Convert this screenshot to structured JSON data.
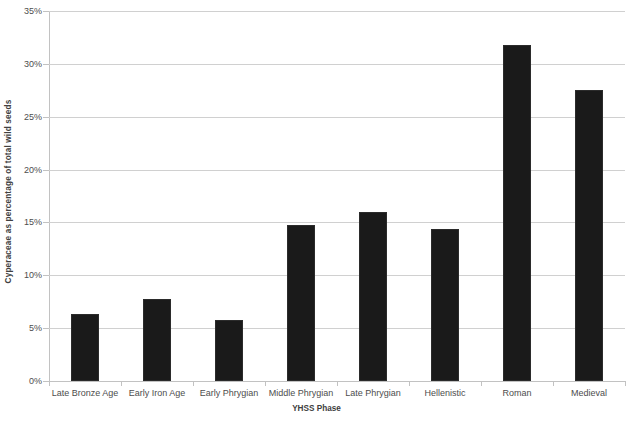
{
  "chart_data": {
    "type": "bar",
    "title": "",
    "xlabel": "YHSS Phase",
    "ylabel": "Cyperaceae as percentage of total wild seeds",
    "categories": [
      "Late Bronze Age",
      "Early Iron Age",
      "Early Phrygian",
      "Middle Phrygian",
      "Late Phrygian",
      "Hellenistic",
      "Roman",
      "Medieval"
    ],
    "values": [
      6.3,
      7.8,
      5.8,
      14.8,
      16.0,
      14.4,
      31.8,
      27.5
    ],
    "ylim": [
      0,
      35
    ],
    "ytick_values": [
      0,
      5,
      10,
      15,
      20,
      25,
      30,
      35
    ],
    "ytick_labels": [
      "0%",
      "5%",
      "10%",
      "15%",
      "20%",
      "25%",
      "30%",
      "35%"
    ],
    "grid": true,
    "legend": false,
    "bar_color": "#1a1a1a",
    "gridline_color": "#d0d0d0",
    "axis_color": "#c2c2c2"
  }
}
